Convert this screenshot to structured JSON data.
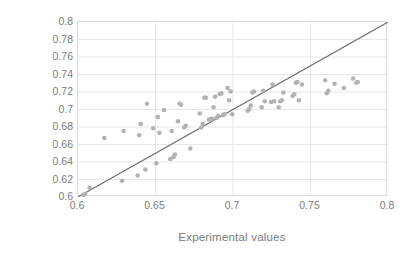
{
  "chart_data": {
    "type": "scatter",
    "title": "",
    "xlabel": "Experimental values",
    "ylabel": "Predicted Values",
    "xlim": [
      0.6,
      0.8
    ],
    "ylim": [
      0.6,
      0.8
    ],
    "xticks": [
      "0.6",
      "0.65",
      "0.7",
      "0.75",
      "0.8"
    ],
    "xtick_values": [
      0.6,
      0.65,
      0.7,
      0.75,
      0.8
    ],
    "yticks": [
      "0.6",
      "0.62",
      "0.64",
      "0.66",
      "0.68",
      "0.7",
      "0.72",
      "0.74",
      "0.76",
      "0.78",
      "0.8"
    ],
    "ytick_values": [
      0.6,
      0.62,
      0.64,
      0.66,
      0.68,
      0.7,
      0.72,
      0.74,
      0.76,
      0.78,
      0.8
    ],
    "grid": true,
    "grid_color": "#e8e8e8",
    "legend": null,
    "marker_color": "#b3b3b3",
    "marker_size": 4.6,
    "reference_line": {
      "name": "y = x identity line",
      "from": [
        0.6,
        0.6
      ],
      "to": [
        0.8,
        0.8
      ],
      "color": "#6e6e6e",
      "width": 1.1
    },
    "series": [
      {
        "name": "Predicted vs Experimental",
        "points": [
          [
            0.6035,
            0.6025
          ],
          [
            0.6045,
            0.6035
          ],
          [
            0.6075,
            0.6105
          ],
          [
            0.617,
            0.6675
          ],
          [
            0.6285,
            0.6185
          ],
          [
            0.6295,
            0.6755
          ],
          [
            0.6385,
            0.6245
          ],
          [
            0.6395,
            0.6705
          ],
          [
            0.6405,
            0.6835
          ],
          [
            0.6435,
            0.6315
          ],
          [
            0.6445,
            0.7065
          ],
          [
            0.6485,
            0.6785
          ],
          [
            0.6505,
            0.6385
          ],
          [
            0.6515,
            0.6915
          ],
          [
            0.6525,
            0.6735
          ],
          [
            0.6555,
            0.6995
          ],
          [
            0.6595,
            0.6435
          ],
          [
            0.6605,
            0.6755
          ],
          [
            0.6615,
            0.6455
          ],
          [
            0.6625,
            0.6485
          ],
          [
            0.6645,
            0.6865
          ],
          [
            0.6655,
            0.7065
          ],
          [
            0.6665,
            0.7055
          ],
          [
            0.6685,
            0.6795
          ],
          [
            0.6695,
            0.6815
          ],
          [
            0.6725,
            0.6555
          ],
          [
            0.6785,
            0.6955
          ],
          [
            0.6795,
            0.6795
          ],
          [
            0.6805,
            0.6835
          ],
          [
            0.6815,
            0.7135
          ],
          [
            0.6825,
            0.7135
          ],
          [
            0.6845,
            0.6885
          ],
          [
            0.6855,
            0.6885
          ],
          [
            0.6865,
            0.6895
          ],
          [
            0.6875,
            0.7025
          ],
          [
            0.6885,
            0.7145
          ],
          [
            0.6895,
            0.6905
          ],
          [
            0.6905,
            0.6925
          ],
          [
            0.6915,
            0.7175
          ],
          [
            0.6925,
            0.7185
          ],
          [
            0.6935,
            0.6935
          ],
          [
            0.6945,
            0.6945
          ],
          [
            0.6965,
            0.7245
          ],
          [
            0.6975,
            0.7105
          ],
          [
            0.6985,
            0.7205
          ],
          [
            0.6995,
            0.6945
          ],
          [
            0.7095,
            0.6985
          ],
          [
            0.7105,
            0.7005
          ],
          [
            0.7115,
            0.7045
          ],
          [
            0.7125,
            0.7195
          ],
          [
            0.7135,
            0.7205
          ],
          [
            0.7185,
            0.7025
          ],
          [
            0.7195,
            0.7215
          ],
          [
            0.7205,
            0.7095
          ],
          [
            0.7245,
            0.7085
          ],
          [
            0.7255,
            0.7285
          ],
          [
            0.7265,
            0.7095
          ],
          [
            0.7295,
            0.7025
          ],
          [
            0.7305,
            0.7095
          ],
          [
            0.7315,
            0.7105
          ],
          [
            0.7325,
            0.7195
          ],
          [
            0.7385,
            0.7155
          ],
          [
            0.7395,
            0.7175
          ],
          [
            0.7405,
            0.7305
          ],
          [
            0.7415,
            0.7315
          ],
          [
            0.7425,
            0.7105
          ],
          [
            0.7445,
            0.7285
          ],
          [
            0.7595,
            0.7335
          ],
          [
            0.7605,
            0.7185
          ],
          [
            0.7615,
            0.7215
          ],
          [
            0.7655,
            0.7295
          ],
          [
            0.7715,
            0.7245
          ],
          [
            0.7775,
            0.7355
          ],
          [
            0.7795,
            0.7305
          ],
          [
            0.7805,
            0.7315
          ]
        ]
      }
    ]
  },
  "axes": {
    "y_title": "Predicted Values",
    "x_title": "Experimental values"
  }
}
